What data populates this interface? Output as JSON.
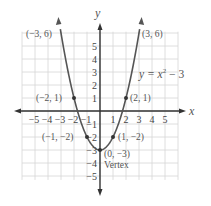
{
  "chart_data": {
    "type": "line",
    "title": "",
    "equation_label": "y = x² − 3",
    "xlabel": "x",
    "ylabel": "y",
    "xlim": [
      -6,
      6
    ],
    "ylim": [
      -5.3,
      6.2
    ],
    "grid": true,
    "x_ticks": [
      "-5",
      "-4",
      "-3",
      "-2",
      "-1",
      "1",
      "2",
      "3",
      "4",
      "5"
    ],
    "y_ticks": [
      "5",
      "4",
      "3",
      "2",
      "1",
      "-1",
      "-2",
      "-3",
      "-4",
      "-5"
    ],
    "series": [
      {
        "name": "y = x^2 - 3",
        "function": "x^2 - 3",
        "x": [
          -3,
          -2,
          -1,
          0,
          1,
          2,
          3
        ],
        "y": [
          6,
          1,
          -2,
          -3,
          -2,
          1,
          6
        ]
      }
    ],
    "points": [
      {
        "x": -3,
        "y": 6,
        "label": "(−3, 6)"
      },
      {
        "x": 3,
        "y": 6,
        "label": "(3, 6)"
      },
      {
        "x": -2,
        "y": 1,
        "label": "(−2, 1)"
      },
      {
        "x": 2,
        "y": 1,
        "label": "(2, 1)"
      },
      {
        "x": -1,
        "y": -2,
        "label": "(−1, −2)"
      },
      {
        "x": 1,
        "y": -2,
        "label": "(1, −2)"
      },
      {
        "x": 0,
        "y": -3,
        "label": "(0, −3)"
      }
    ],
    "annotations": [
      {
        "text": "Vertex",
        "at": [
          0,
          -3
        ]
      }
    ]
  },
  "labels": {
    "x_axis": "x",
    "y_axis": "y",
    "equation": "y = x",
    "equation_exp": "2",
    "equation_tail": " − 3",
    "vertex": "Vertex",
    "p_m3_6": "(−3, 6)",
    "p_3_6": "(3, 6)",
    "p_m2_1": "(−2, 1)",
    "p_2_1": "(2, 1)",
    "p_m1_m2": "(−1, −2)",
    "p_1_m2": "(1, −2)",
    "p_0_m3": "(0, −3)"
  },
  "colors": {
    "grid": "#d6d6d6",
    "axis": "#333333",
    "curve": "#555555",
    "text": "#555555"
  }
}
